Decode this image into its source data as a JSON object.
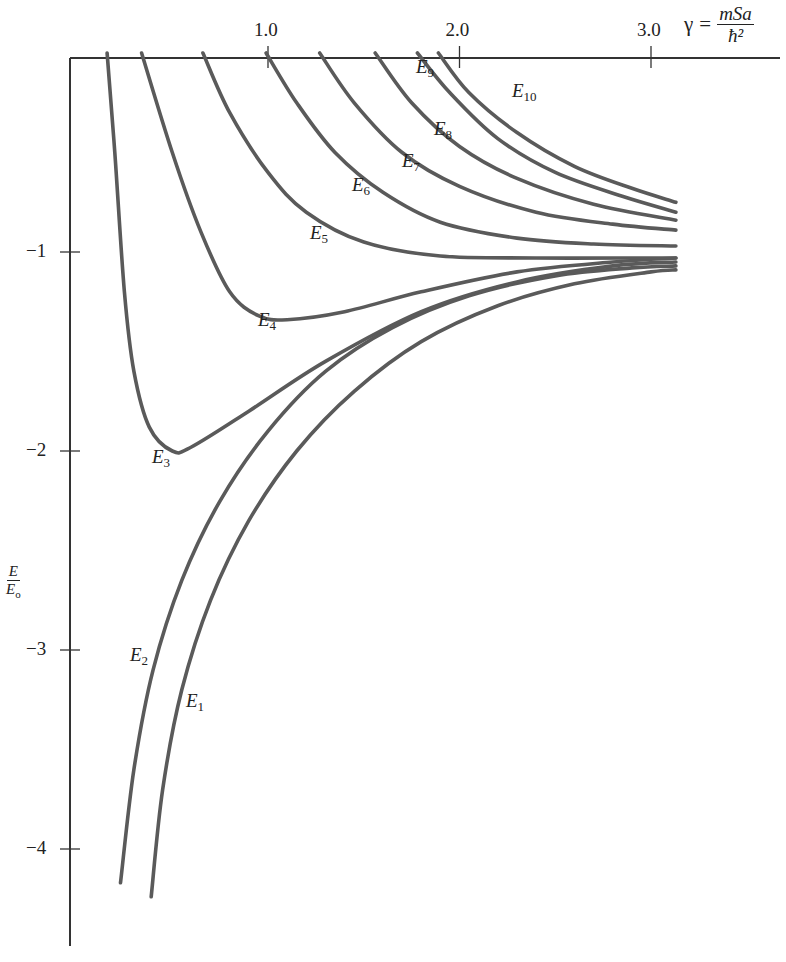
{
  "chart_data": {
    "type": "line",
    "title": "",
    "xlabel": "γ = mSa/ħ²",
    "xlabel_parts": {
      "symbol": "γ",
      "equals": "=",
      "numerator": "mSa",
      "denominator": "ħ²"
    },
    "ylabel": "E/E₀",
    "ylabel_parts": {
      "numerator": "E",
      "denominator": "E",
      "denominator_sub": "o"
    },
    "x_ticks": [
      1.0,
      2.0,
      3.0
    ],
    "x_tick_labels": [
      "1.0",
      "2.0",
      "3.0"
    ],
    "y_ticks": [
      -1,
      -2,
      -3,
      -4
    ],
    "y_tick_labels": [
      "−1",
      "−2",
      "−3",
      "−4"
    ],
    "xlim": [
      0,
      3.2
    ],
    "ylim": [
      -4.5,
      0
    ],
    "x_axis_position": "top",
    "grid": false,
    "legend": "inline labels",
    "series": [
      {
        "name": "E1",
        "label": "E",
        "sub": "1",
        "label_pos": [
          186,
          706
        ],
        "points": [
          [
            0.39,
            -4.24
          ],
          [
            0.45,
            -3.7
          ],
          [
            0.55,
            -3.2
          ],
          [
            0.7,
            -2.75
          ],
          [
            0.9,
            -2.35
          ],
          [
            1.15,
            -2.0
          ],
          [
            1.45,
            -1.7
          ],
          [
            1.8,
            -1.45
          ],
          [
            2.2,
            -1.27
          ],
          [
            2.6,
            -1.16
          ],
          [
            3.0,
            -1.1
          ],
          [
            3.13,
            -1.09
          ]
        ]
      },
      {
        "name": "E2",
        "label": "E",
        "sub": "2",
        "label_pos": [
          130,
          660
        ],
        "points": [
          [
            0.23,
            -4.17
          ],
          [
            0.3,
            -3.6
          ],
          [
            0.4,
            -3.1
          ],
          [
            0.55,
            -2.65
          ],
          [
            0.75,
            -2.25
          ],
          [
            1.0,
            -1.9
          ],
          [
            1.3,
            -1.6
          ],
          [
            1.65,
            -1.38
          ],
          [
            2.05,
            -1.22
          ],
          [
            2.5,
            -1.12
          ],
          [
            2.9,
            -1.08
          ],
          [
            3.13,
            -1.07
          ]
        ]
      },
      {
        "name": "E3",
        "label": "E",
        "sub": "3",
        "label_pos": [
          152,
          462
        ],
        "points": [
          [
            0.16,
            0.0
          ],
          [
            0.2,
            -0.5
          ],
          [
            0.25,
            -1.2
          ],
          [
            0.3,
            -1.6
          ],
          [
            0.38,
            -1.88
          ],
          [
            0.5,
            -2.0
          ],
          [
            0.6,
            -1.98
          ],
          [
            0.9,
            -1.8
          ],
          [
            1.3,
            -1.55
          ],
          [
            1.8,
            -1.3
          ],
          [
            2.3,
            -1.15
          ],
          [
            2.8,
            -1.07
          ],
          [
            3.13,
            -1.05
          ]
        ]
      },
      {
        "name": "E4",
        "label": "E",
        "sub": "4",
        "label_pos": [
          258,
          325
        ],
        "points": [
          [
            0.34,
            0.0
          ],
          [
            0.5,
            -0.5
          ],
          [
            0.65,
            -0.9
          ],
          [
            0.8,
            -1.2
          ],
          [
            0.95,
            -1.32
          ],
          [
            1.1,
            -1.34
          ],
          [
            1.4,
            -1.3
          ],
          [
            1.8,
            -1.2
          ],
          [
            2.3,
            -1.1
          ],
          [
            2.8,
            -1.05
          ],
          [
            3.13,
            -1.03
          ]
        ]
      },
      {
        "name": "E5",
        "label": "E",
        "sub": "5",
        "label_pos": [
          310,
          238
        ],
        "points": [
          [
            0.66,
            0.0
          ],
          [
            0.8,
            -0.3
          ],
          [
            1.0,
            -0.6
          ],
          [
            1.2,
            -0.8
          ],
          [
            1.5,
            -0.95
          ],
          [
            1.9,
            -1.02
          ],
          [
            2.4,
            -1.03
          ],
          [
            2.9,
            -1.03
          ],
          [
            3.13,
            -1.03
          ]
        ]
      },
      {
        "name": "E6",
        "label": "E",
        "sub": "6",
        "label_pos": [
          352,
          190
        ],
        "points": [
          [
            0.99,
            0.0
          ],
          [
            1.15,
            -0.25
          ],
          [
            1.35,
            -0.5
          ],
          [
            1.6,
            -0.7
          ],
          [
            1.9,
            -0.85
          ],
          [
            2.3,
            -0.93
          ],
          [
            2.7,
            -0.96
          ],
          [
            3.13,
            -0.97
          ]
        ]
      },
      {
        "name": "E7",
        "label": "E",
        "sub": "7",
        "label_pos": [
          402,
          166
        ],
        "points": [
          [
            1.27,
            0.0
          ],
          [
            1.45,
            -0.25
          ],
          [
            1.7,
            -0.5
          ],
          [
            2.0,
            -0.67
          ],
          [
            2.4,
            -0.8
          ],
          [
            2.8,
            -0.86
          ],
          [
            3.13,
            -0.89
          ]
        ]
      },
      {
        "name": "E8",
        "label": "E",
        "sub": "8",
        "label_pos": [
          434,
          134
        ],
        "points": [
          [
            1.56,
            0.0
          ],
          [
            1.75,
            -0.25
          ],
          [
            2.0,
            -0.47
          ],
          [
            2.3,
            -0.63
          ],
          [
            2.7,
            -0.76
          ],
          [
            3.13,
            -0.84
          ]
        ]
      },
      {
        "name": "E9",
        "label": "E",
        "sub": "9",
        "label_pos": [
          416,
          72
        ],
        "points": [
          [
            1.78,
            0.0
          ],
          [
            1.95,
            -0.2
          ],
          [
            2.2,
            -0.43
          ],
          [
            2.5,
            -0.6
          ],
          [
            2.85,
            -0.72
          ],
          [
            3.13,
            -0.8
          ]
        ]
      },
      {
        "name": "E10",
        "label": "E",
        "sub": "10",
        "label_pos": [
          512,
          96
        ],
        "points": [
          [
            1.89,
            0.0
          ],
          [
            2.05,
            -0.2
          ],
          [
            2.3,
            -0.4
          ],
          [
            2.6,
            -0.57
          ],
          [
            2.9,
            -0.68
          ],
          [
            3.13,
            -0.75
          ]
        ]
      }
    ]
  },
  "layout": {
    "x_origin_px": 76.5,
    "x_unit_px": 191.5,
    "y_origin_px": 53,
    "y_unit_px": 199,
    "axis_left_px": 70,
    "axis_top_px": 58,
    "axis_right_px": 780,
    "axis_bottom_px": 946
  }
}
